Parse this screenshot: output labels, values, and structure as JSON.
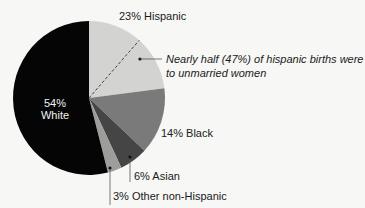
{
  "chart_data": {
    "type": "pie",
    "title": "",
    "start_angle_deg": 0,
    "direction": "clockwise",
    "slices": [
      {
        "key": "hispanic",
        "label": "Hispanic",
        "value": 23,
        "color": "#d3d3d1"
      },
      {
        "key": "black",
        "label": "Black",
        "value": 14,
        "color": "#7a7a7a"
      },
      {
        "key": "asian",
        "label": "Asian",
        "value": 6,
        "color": "#454545"
      },
      {
        "key": "other",
        "label": "Other non-Hispanic",
        "value": 3,
        "color": "#9d9d9b"
      },
      {
        "key": "white",
        "label": "White",
        "value": 54,
        "color": "#050505"
      }
    ],
    "annotation": {
      "slice": "hispanic",
      "sub_share_pct": 47,
      "text_line1": "Nearly half (47%) of hispanic births were",
      "text_line2": "to unmarried women",
      "divider": "dashed"
    },
    "legend": "none (direct labels)"
  },
  "labels": {
    "hispanic": "23% Hispanic",
    "black": "14% Black",
    "asian": "6% Asian",
    "other": "3% Other non-Hispanic",
    "white_pct": "54%",
    "white_name": "White",
    "note_line1": "Nearly half (47%) of hispanic births were",
    "note_line2": "to unmarried women"
  }
}
